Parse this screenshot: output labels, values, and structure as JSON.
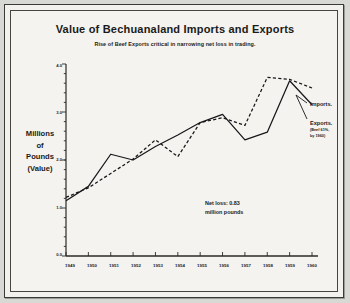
{
  "chart_data": {
    "type": "line",
    "title": "Value of Bechuanaland Imports and Exports",
    "subtitle": "Rise of Beef Exports critical in narrowing net loss in trading.",
    "xlabel": "",
    "ylabel": "Millions of Pounds (Value)",
    "ylabel_lines": [
      "Millions",
      "of",
      "Pounds",
      "(Value)"
    ],
    "x": [
      "1949",
      "1950",
      "1951",
      "1952",
      "1953",
      "1954",
      "1955",
      "1956",
      "1957",
      "1958",
      "1959",
      "1960"
    ],
    "categories": [
      "1949",
      "1950",
      "1951",
      "1952",
      "1953",
      "1954",
      "1955",
      "1956",
      "1957",
      "1958",
      "1959",
      "1960"
    ],
    "yticks": [
      "4.0",
      "3.0",
      "2.0",
      "1.0",
      "0.0"
    ],
    "ytick_values": [
      4.0,
      3.0,
      2.0,
      1.0,
      0.0
    ],
    "ylim": [
      0.0,
      4.0
    ],
    "minor_ticks": true,
    "grid": false,
    "legend_position": "right",
    "series": [
      {
        "name": "Imports.",
        "style": "dashed",
        "values": [
          1.22,
          1.42,
          1.72,
          2.02,
          2.42,
          2.07,
          2.78,
          2.88,
          2.72,
          3.72,
          3.68,
          3.5
        ]
      },
      {
        "name": "Exports.",
        "style": "solid",
        "note_lines": [
          "(Beef 61%,",
          "by 1960)"
        ],
        "values": [
          1.15,
          1.45,
          2.12,
          2.0,
          2.28,
          2.52,
          2.78,
          2.95,
          2.42,
          2.58,
          3.65,
          3.15
        ]
      }
    ],
    "annotations": [
      {
        "name": "net-loss",
        "lines": [
          "Net loss: 0.83",
          "million pounds"
        ]
      }
    ]
  },
  "colors": {
    "ink": "#1a1a18",
    "paper": "#f4f3f0",
    "border": "#46463f"
  }
}
